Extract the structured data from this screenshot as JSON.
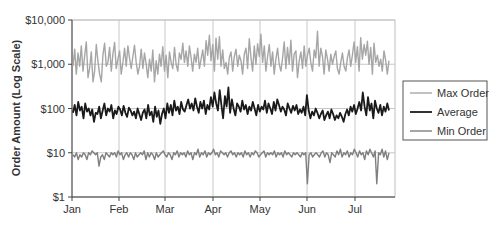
{
  "chart_data": {
    "type": "line",
    "title": "",
    "xlabel": "",
    "ylabel": "Order Amount (Log Scale)",
    "yscale": "log",
    "ylim": [
      1,
      10000
    ],
    "y_ticks": [
      {
        "value": 10000,
        "label": "$10,000"
      },
      {
        "value": 1000,
        "label": "$1,000"
      },
      {
        "value": 100,
        "label": "$100"
      },
      {
        "value": 10,
        "label": "$10"
      },
      {
        "value": 1,
        "label": "$1"
      }
    ],
    "x_ticks": [
      "Jan",
      "Feb",
      "Mar",
      "Apr",
      "May",
      "Jun",
      "Jul"
    ],
    "grid": true,
    "legend_position": "right",
    "series": [
      {
        "name": "Max Order",
        "color": "#a6a6a6",
        "width": 1.4,
        "values": [
          900,
          2200,
          600,
          1800,
          900,
          2600,
          700,
          1500,
          3200,
          500,
          800,
          1900,
          400,
          700,
          2800,
          1200,
          600,
          400,
          1600,
          3000,
          900,
          1100,
          2400,
          700,
          1700,
          3100,
          800,
          1300,
          2000,
          600,
          1100,
          2300,
          900,
          2600,
          1400,
          800,
          1500,
          2700,
          1100,
          600,
          900,
          2200,
          800,
          1800,
          1000,
          500,
          1300,
          700,
          2100,
          400,
          1200,
          600,
          1700,
          900,
          2500,
          700,
          1600,
          500,
          1900,
          1100,
          800,
          2400,
          1000,
          700,
          1800,
          1300,
          3000,
          1100,
          2000,
          900,
          2600,
          1400,
          700,
          1700,
          1100,
          2300,
          800,
          1300,
          2100,
          900,
          3400,
          1600,
          4500,
          1200,
          2800,
          700,
          3900,
          1300,
          4200,
          900,
          2100,
          800,
          1100,
          600,
          1400,
          1900,
          700,
          1500,
          2200,
          900,
          1600,
          1200,
          600,
          1700,
          2300,
          800,
          3800,
          1400,
          700,
          2600,
          1000,
          2900,
          1500,
          4800,
          1100,
          2600,
          700,
          1500,
          2800,
          900,
          1900,
          600,
          1300,
          2300,
          1000,
          700,
          1400,
          3200,
          800,
          2400,
          1000,
          3500,
          700,
          1700,
          2000,
          500,
          1200,
          1900,
          800,
          2600,
          900,
          1600,
          2300,
          1100,
          700,
          2100,
          1400,
          5600,
          900,
          2300,
          1500,
          600,
          2100,
          1300,
          700,
          1700,
          1000,
          1500,
          2000,
          800,
          600,
          1100,
          1800,
          900,
          700,
          1400,
          2100,
          900,
          1600,
          3200,
          1100,
          2500,
          700,
          4000,
          1300,
          2800,
          1600,
          3300,
          1000,
          2400,
          600,
          3000,
          1100,
          1600,
          900,
          1300,
          700,
          2000,
          1200,
          600,
          1200
        ],
        "note": "daily values, Jan 1 – late Jul; fluctuates ~$300–$6,000"
      },
      {
        "name": "Average",
        "color": "#1a1a1a",
        "width": 1.8,
        "values": [
          80,
          120,
          70,
          140,
          90,
          110,
          60,
          130,
          85,
          100,
          70,
          95,
          50,
          80,
          75,
          110,
          60,
          90,
          130,
          70,
          100,
          85,
          120,
          60,
          90,
          75,
          110,
          95,
          70,
          115,
          80,
          65,
          105,
          90,
          70,
          85,
          60,
          100,
          75,
          55,
          80,
          95,
          60,
          120,
          70,
          85,
          50,
          110,
          65,
          90,
          45,
          75,
          100,
          60,
          130,
          80,
          120,
          70,
          150,
          90,
          110,
          75,
          140,
          95,
          85,
          120,
          160,
          100,
          130,
          90,
          170,
          110,
          80,
          140,
          100,
          150,
          75,
          120,
          95,
          180,
          110,
          230,
          130,
          90,
          260,
          120,
          60,
          190,
          110,
          300,
          80,
          160,
          100,
          70,
          130,
          110,
          85,
          150,
          95,
          120,
          75,
          110,
          90,
          140,
          100,
          70,
          120,
          85,
          110,
          95,
          150,
          80,
          130,
          100,
          75,
          140,
          90,
          160,
          120,
          85,
          110,
          95,
          70,
          130,
          100,
          80,
          115,
          90,
          120,
          75,
          95,
          80,
          110,
          70,
          200,
          90,
          60,
          85,
          70,
          100,
          80,
          60,
          75,
          90,
          55,
          70,
          85,
          60,
          95,
          75,
          55,
          70,
          60,
          80,
          65,
          50,
          75,
          95,
          70,
          110,
          85,
          120,
          75,
          100,
          140,
          90,
          230,
          110,
          70,
          180,
          90,
          130,
          60,
          150,
          100,
          80,
          120,
          70,
          110,
          85,
          130,
          90
        ],
        "note": "fluctuates ~$40–$300"
      },
      {
        "name": "Min Order",
        "color": "#7f7f7f",
        "width": 1.4,
        "values": [
          9,
          8,
          10,
          7,
          9,
          8,
          10,
          9,
          7,
          10,
          9,
          11,
          10,
          9,
          10,
          5,
          8,
          9,
          7,
          10,
          9,
          8,
          10,
          9,
          10,
          8,
          11,
          9,
          10,
          7,
          9,
          10,
          8,
          10,
          9,
          7,
          10,
          8,
          9,
          10,
          9,
          11,
          7,
          10,
          8,
          10,
          9,
          7,
          10,
          8,
          9,
          10,
          11,
          9,
          8,
          10,
          9,
          7,
          10,
          9,
          11,
          8,
          10,
          9,
          10,
          8,
          11,
          9,
          10,
          7,
          10,
          9,
          12,
          8,
          10,
          9,
          11,
          8,
          10,
          9,
          10,
          12,
          9,
          10,
          8,
          11,
          10,
          9,
          10,
          8,
          10,
          11,
          9,
          10,
          8,
          10,
          9,
          10,
          8,
          11,
          9,
          10,
          8,
          10,
          9,
          11,
          10,
          8,
          9,
          10,
          11,
          8,
          10,
          9,
          10,
          9,
          11,
          8,
          10,
          9,
          10,
          8,
          11,
          9,
          10,
          9,
          8,
          10,
          9,
          10,
          9,
          8,
          10,
          9,
          10,
          2,
          9,
          10,
          8,
          9,
          10,
          9,
          8,
          10,
          11,
          8,
          10,
          9,
          6,
          10,
          9,
          8,
          11,
          9,
          12,
          8,
          10,
          9,
          11,
          8,
          10,
          9,
          12,
          10,
          8,
          11,
          9,
          10,
          7,
          11,
          9,
          12,
          10,
          8,
          11,
          2,
          10,
          9,
          12,
          8,
          11,
          7,
          10
        ],
        "note": "mostly ~$6–$12 with dips near $2 in Jun and Jul"
      }
    ]
  }
}
